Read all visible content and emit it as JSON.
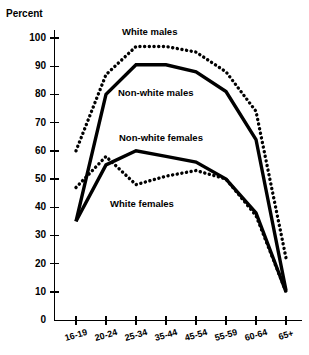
{
  "chart_data": {
    "type": "line",
    "title": "",
    "ylabel": "Percent",
    "xlabel": "",
    "ylim": [
      0,
      100
    ],
    "yticks": [
      0,
      10,
      20,
      30,
      40,
      50,
      60,
      70,
      80,
      90,
      100
    ],
    "grid": false,
    "legend_position": "inline-annotations",
    "categories": [
      "16-19",
      "20-24",
      "25-34",
      "35-44",
      "45-54",
      "55-59",
      "60-64",
      "65+"
    ],
    "series": [
      {
        "name": "White males",
        "style": "dotted",
        "values": [
          60,
          87,
          97,
          97,
          95,
          88,
          74,
          22
        ]
      },
      {
        "name": "Non-white males",
        "style": "solid",
        "values": [
          35,
          80,
          90.5,
          90.5,
          88,
          81,
          64,
          10.5
        ]
      },
      {
        "name": "Non-white females",
        "style": "solid",
        "values": [
          35,
          55,
          60,
          58,
          56,
          50,
          38,
          10
        ]
      },
      {
        "name": "White females",
        "style": "dotted",
        "values": [
          47,
          58,
          48,
          51,
          53,
          50,
          37,
          10
        ]
      }
    ]
  },
  "axis": {
    "y_title": "Percent",
    "y_tick_labels": [
      "100",
      "90",
      "80",
      "70",
      "60",
      "50",
      "40",
      "30",
      "20",
      "10",
      "0"
    ],
    "x_tick_labels": [
      "16-19",
      "20-24",
      "25-34",
      "35-44",
      "45-54",
      "55-59",
      "60-64",
      "65+"
    ]
  },
  "annotations": [
    {
      "text": "White males",
      "x": 122,
      "y": 27
    },
    {
      "text": "Non-white males",
      "x": 118,
      "y": 88
    },
    {
      "text": "Non-white females",
      "x": 119,
      "y": 133
    },
    {
      "text": "White females",
      "x": 110,
      "y": 199
    }
  ]
}
